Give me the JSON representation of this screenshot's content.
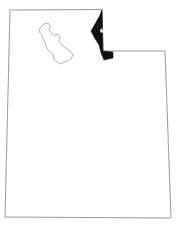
{
  "map": {
    "title": "Utah",
    "highlighted_region": "Rich County",
    "features": [
      {
        "name": "state-outline",
        "stroke": "#9a9a9a",
        "fill": "#ffffff"
      },
      {
        "name": "great-salt-lake",
        "stroke": "#a8a8a8",
        "fill": "#ffffff"
      },
      {
        "name": "highlighted-county",
        "fill": "#111111"
      }
    ]
  }
}
